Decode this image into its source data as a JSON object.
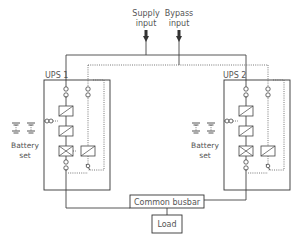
{
  "diagram": {
    "type": "parallel-redundant-ups",
    "inputs": {
      "supply": "Supply\ninput",
      "supply_line1": "Supply",
      "supply_line2": "input",
      "bypass_line1": "Bypass",
      "bypass_line2": "input"
    },
    "units": [
      {
        "id": "ups1",
        "label": "UPS 1",
        "battery_line1": "Battery",
        "battery_line2": "set"
      },
      {
        "id": "ups2",
        "label": "UPS 2",
        "battery_line1": "Battery",
        "battery_line2": "set"
      }
    ],
    "busbar": {
      "label": "Common busbar"
    },
    "load": {
      "label": "Load"
    },
    "colors": {
      "line": "#444444",
      "text": "#555555",
      "background": "#ffffff"
    }
  }
}
